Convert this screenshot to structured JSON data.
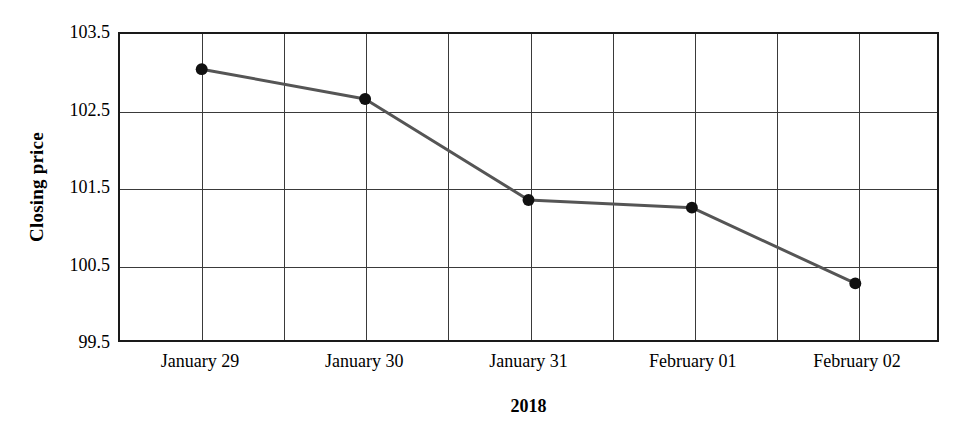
{
  "chart_data": {
    "type": "line",
    "title": "",
    "subtitle": "",
    "xlabel": "2018",
    "ylabel": "Closing price",
    "categories": [
      "January 29",
      "January 30",
      "January 31",
      "February 01",
      "February 02"
    ],
    "values": [
      103.04,
      102.65,
      101.33,
      101.23,
      100.24
    ],
    "series": [
      {
        "name": "Closing price",
        "values": [
          103.04,
          102.65,
          101.33,
          101.23,
          100.24
        ]
      }
    ],
    "ylim": [
      99.5,
      103.5
    ],
    "y_ticks": [
      99.5,
      100.5,
      101.5,
      102.5,
      103.5
    ],
    "y_tick_labels": [
      "99.5",
      "100.5",
      "101.5",
      "102.5",
      "103.5"
    ],
    "x_tick_labels": [
      "January 29",
      "January 30",
      "January 31",
      "February 01",
      "February 02"
    ],
    "grid": true,
    "grid_vertical_count": 10,
    "legend": "none",
    "legend_position": "none",
    "marker": "circle",
    "line_color": "#555555",
    "marker_color": "#111111",
    "grid_color": "#3a3a3a",
    "axis_color": "#1a1a1a",
    "background_color": "#ffffff"
  }
}
